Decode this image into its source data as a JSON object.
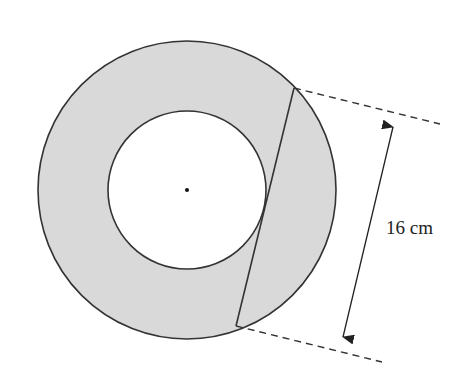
{
  "diagram": {
    "type": "annulus-with-tangent-chord",
    "chord_length_label": "16 cm",
    "shading_color": "#d9d9d9",
    "line_color": "#333333",
    "background_color": "#ffffff"
  }
}
